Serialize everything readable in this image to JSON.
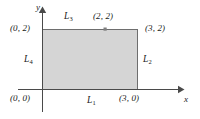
{
  "figure": {
    "background_color": "#ffffff",
    "fill_color": "#d5d5d5",
    "stroke_color": "#6e6e6e",
    "axis_color": "#4a4a4a",
    "text_color": "#1a1a1a"
  },
  "axes": {
    "x_label": "x",
    "y_label": "y",
    "origin_label": "(0, 0)"
  },
  "region": {
    "type": "rectangle",
    "x_min": 0,
    "x_max": 3,
    "y_min": 0,
    "y_max": 2,
    "corners": [
      {
        "name": "bottom-left",
        "label": "(0, 0)"
      },
      {
        "name": "bottom-right",
        "label": "(3, 0)"
      },
      {
        "name": "top-right",
        "label": "(3, 2)"
      },
      {
        "name": "top-left",
        "label": "(0, 2)"
      }
    ]
  },
  "segments": [
    {
      "id": "L1",
      "name": "L",
      "subscript": "1",
      "description": "bottom edge from (0, 0) to (3, 0)"
    },
    {
      "id": "L2",
      "name": "L",
      "subscript": "2",
      "description": "right edge from (3, 0) to (3, 2)"
    },
    {
      "id": "L3",
      "name": "L",
      "subscript": "3",
      "description": "top edge from (3, 2) to (0, 2)"
    },
    {
      "id": "L4",
      "name": "L",
      "subscript": "4",
      "description": "left edge from (0, 2) to (0, 0)"
    }
  ],
  "points": [
    {
      "label": "(2, 2)",
      "x": 2,
      "y": 2,
      "marker": "square",
      "on_segment": "L3"
    }
  ]
}
